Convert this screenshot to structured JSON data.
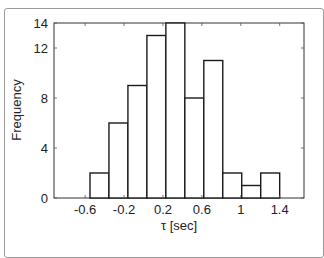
{
  "chart_data": {
    "type": "bar",
    "subtype": "histogram",
    "title": "",
    "xlabel": "τ [sec]",
    "ylabel": "Frequency",
    "xlim": [
      -0.92,
      1.65
    ],
    "ylim": [
      0,
      14
    ],
    "xticks": [
      "-0.6",
      "-0.2",
      "0.2",
      "0.6",
      "1",
      "1.4"
    ],
    "xtick_values": [
      -0.6,
      -0.2,
      0.2,
      0.6,
      1.0,
      1.4
    ],
    "yticks": [
      "0",
      "4",
      "8",
      "12",
      "14"
    ],
    "ytick_values": [
      0,
      4,
      8,
      12,
      14
    ],
    "bin_width": 0.195,
    "bin_edges": [
      -0.55,
      -0.355,
      -0.16,
      0.035,
      0.23,
      0.425,
      0.62,
      0.815,
      1.01,
      1.205,
      1.4
    ],
    "categories": [
      "-0.45",
      "-0.26",
      "-0.06",
      "0.13",
      "0.33",
      "0.52",
      "0.72",
      "0.91",
      "1.11",
      "1.30"
    ],
    "values": [
      2,
      6,
      9,
      13,
      14,
      8,
      11,
      2,
      1,
      2
    ],
    "grid": false,
    "legend": null,
    "bar_fill": "#ffffff",
    "bar_edge": "#1a1a1a"
  }
}
